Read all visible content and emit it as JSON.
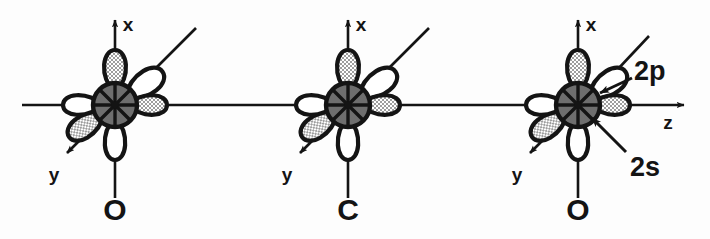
{
  "figure": {
    "background_color": "#fdfdfd",
    "ink_color": "#141414",
    "core_fill_color": "#6e6e6e",
    "lobe_shaded_color": "#b9b9b9",
    "lobe_plain_color": "#ffffff"
  },
  "bond_axis": {
    "name": "z",
    "label": "z",
    "orientation": "horizontal",
    "y": 105,
    "x_start": 22,
    "x_end": 691,
    "arrow": "right"
  },
  "atoms": [
    {
      "id": "left-oxygen",
      "element_label": "O",
      "cx": 115,
      "cy": 105,
      "axes": [
        {
          "name": "x",
          "label": "x",
          "direction": "up",
          "arrow": true
        },
        {
          "name": "y",
          "label": "y",
          "direction": "down-left",
          "arrow": true
        },
        {
          "name": "z",
          "label": "",
          "direction": "horizontal",
          "arrow": false
        }
      ],
      "orbitals": [
        {
          "name": "2s",
          "type": "s",
          "fill": "core"
        },
        {
          "name": "2p-up",
          "type": "p",
          "angle_deg": -90,
          "fill": "shaded"
        },
        {
          "name": "2p-upper-right",
          "type": "p",
          "angle_deg": -35,
          "fill": "plain"
        },
        {
          "name": "2p-right",
          "type": "p",
          "angle_deg": 0,
          "fill": "shaded"
        },
        {
          "name": "2p-down",
          "type": "p",
          "angle_deg": 90,
          "fill": "plain"
        },
        {
          "name": "2p-lower-left",
          "type": "p",
          "angle_deg": 145,
          "fill": "shaded"
        },
        {
          "name": "2p-left",
          "type": "p",
          "angle_deg": 180,
          "fill": "plain"
        }
      ],
      "leader_line": true,
      "callouts": []
    },
    {
      "id": "center-carbon",
      "element_label": "C",
      "cx": 348,
      "cy": 105,
      "axes": [
        {
          "name": "x",
          "label": "x",
          "direction": "up",
          "arrow": true
        },
        {
          "name": "y",
          "label": "y",
          "direction": "down-left",
          "arrow": true
        },
        {
          "name": "z",
          "label": "",
          "direction": "horizontal",
          "arrow": false
        }
      ],
      "orbitals": [
        {
          "name": "2s",
          "type": "s",
          "fill": "core"
        },
        {
          "name": "2p-up",
          "type": "p",
          "angle_deg": -90,
          "fill": "shaded"
        },
        {
          "name": "2p-upper-right",
          "type": "p",
          "angle_deg": -35,
          "fill": "plain"
        },
        {
          "name": "2p-right",
          "type": "p",
          "angle_deg": 0,
          "fill": "shaded"
        },
        {
          "name": "2p-down",
          "type": "p",
          "angle_deg": 90,
          "fill": "plain"
        },
        {
          "name": "2p-lower-left",
          "type": "p",
          "angle_deg": 145,
          "fill": "shaded"
        },
        {
          "name": "2p-left",
          "type": "p",
          "angle_deg": 180,
          "fill": "plain"
        }
      ],
      "leader_line": true,
      "callouts": []
    },
    {
      "id": "right-oxygen",
      "element_label": "O",
      "cx": 578,
      "cy": 105,
      "axes": [
        {
          "name": "x",
          "label": "x",
          "direction": "up",
          "arrow": true
        },
        {
          "name": "y",
          "label": "y",
          "direction": "down-left",
          "arrow": true
        },
        {
          "name": "z",
          "label": "z",
          "direction": "horizontal",
          "arrow": true
        }
      ],
      "orbitals": [
        {
          "name": "2s",
          "type": "s",
          "fill": "core"
        },
        {
          "name": "2p-up",
          "type": "p",
          "angle_deg": -90,
          "fill": "shaded"
        },
        {
          "name": "2p-upper-right",
          "type": "p",
          "angle_deg": -35,
          "fill": "plain"
        },
        {
          "name": "2p-right",
          "type": "p",
          "angle_deg": 0,
          "fill": "shaded"
        },
        {
          "name": "2p-down",
          "type": "p",
          "angle_deg": 90,
          "fill": "plain"
        },
        {
          "name": "2p-lower-left",
          "type": "p",
          "angle_deg": 145,
          "fill": "shaded"
        },
        {
          "name": "2p-left",
          "type": "p",
          "angle_deg": 180,
          "fill": "plain"
        }
      ],
      "leader_line": true,
      "callouts": [
        {
          "name": "2p-callout",
          "label": "2p",
          "label_x": 634,
          "label_y": 80,
          "arrow_from_x": 630,
          "arrow_from_y": 77,
          "arrow_to_x": 596,
          "arrow_to_y": 94
        },
        {
          "name": "2s-callout",
          "label": "2s",
          "label_x": 614,
          "label_y": 172,
          "arrow_from_x": 624,
          "arrow_from_y": 150,
          "arrow_to_x": 588,
          "arrow_to_y": 118
        }
      ]
    }
  ],
  "axis_labels": {
    "x": "x",
    "y": "y",
    "z": "z"
  },
  "element_labels": {
    "left": "O",
    "center": "C",
    "right": "O"
  },
  "orbital_labels": {
    "p": "2p",
    "s": "2s"
  }
}
